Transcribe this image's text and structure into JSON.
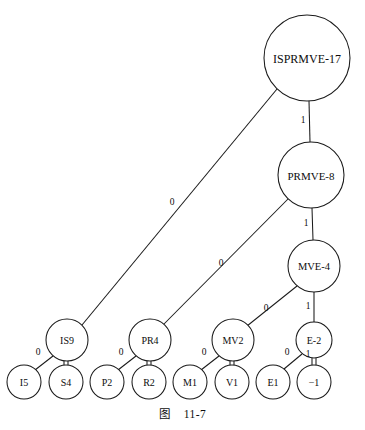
{
  "figure": {
    "caption_label": "图",
    "caption_number": "11-7",
    "caption_full": "图    11-7",
    "line_color": "#1a1a1a",
    "text_color": "#0d0d0d",
    "background_color": "#ffffff"
  },
  "diagram": {
    "type": "binary-decision-tree",
    "nodes": [
      {
        "id": "root",
        "label": "ISPRMVE-17",
        "cx": 307,
        "cy": 58,
        "r": 43,
        "font_size": 12
      },
      {
        "id": "n2",
        "label": "PRMVE-8",
        "cx": 311,
        "cy": 175,
        "r": 33,
        "font_size": 11
      },
      {
        "id": "n3",
        "label": "MVE-4",
        "cx": 314,
        "cy": 266,
        "r": 26,
        "font_size": 10.5
      },
      {
        "id": "is9",
        "label": "IS9",
        "cx": 67,
        "cy": 340,
        "r": 21,
        "font_size": 10
      },
      {
        "id": "pr4",
        "label": "PR4",
        "cx": 150,
        "cy": 340,
        "r": 21,
        "font_size": 10
      },
      {
        "id": "mv2",
        "label": "MV2",
        "cx": 233,
        "cy": 340,
        "r": 21,
        "font_size": 10
      },
      {
        "id": "e2",
        "label": "E-2",
        "cx": 314,
        "cy": 340,
        "r": 18,
        "font_size": 10
      },
      {
        "id": "l_i5",
        "label": "I5",
        "cx": 24,
        "cy": 382,
        "r": 17,
        "font_size": 10
      },
      {
        "id": "l_s4",
        "label": "S4",
        "cx": 66,
        "cy": 382,
        "r": 17,
        "font_size": 10
      },
      {
        "id": "l_p2",
        "label": "P2",
        "cx": 107,
        "cy": 382,
        "r": 17,
        "font_size": 10
      },
      {
        "id": "l_r2",
        "label": "R2",
        "cx": 149,
        "cy": 382,
        "r": 17,
        "font_size": 10
      },
      {
        "id": "l_m1",
        "label": "M1",
        "cx": 190,
        "cy": 382,
        "r": 17,
        "font_size": 10
      },
      {
        "id": "l_v1",
        "label": "V1",
        "cx": 232,
        "cy": 382,
        "r": 17,
        "font_size": 10
      },
      {
        "id": "l_e1",
        "label": "E1",
        "cx": 273,
        "cy": 382,
        "r": 17,
        "font_size": 10
      },
      {
        "id": "l_neg1",
        "label": "−1",
        "cx": 314,
        "cy": 382,
        "r": 17,
        "font_size": 10
      }
    ],
    "edges": [
      {
        "id": "e_root_is9",
        "from": "root",
        "to": "is9",
        "label": "0",
        "style": "single",
        "x1": 277,
        "y1": 89,
        "x2": 82,
        "y2": 325,
        "lx": 172,
        "ly": 202
      },
      {
        "id": "e_root_n2",
        "from": "root",
        "to": "n2",
        "label": "1",
        "style": "single",
        "x1": 309,
        "y1": 101,
        "x2": 310,
        "y2": 142,
        "lx": 303,
        "ly": 120
      },
      {
        "id": "e_n2_pr4",
        "from": "n2",
        "to": "pr4",
        "label": "0",
        "style": "single",
        "x1": 288,
        "y1": 199,
        "x2": 164,
        "y2": 324,
        "lx": 221,
        "ly": 263
      },
      {
        "id": "e_n2_n3",
        "from": "n2",
        "to": "n3",
        "label": "1",
        "style": "single",
        "x1": 312,
        "y1": 208,
        "x2": 313,
        "y2": 240,
        "lx": 306,
        "ly": 223
      },
      {
        "id": "e_n3_mv2",
        "from": "n3",
        "to": "mv2",
        "label": "0",
        "style": "single",
        "x1": 297,
        "y1": 286,
        "x2": 247,
        "y2": 326,
        "lx": 266,
        "ly": 308
      },
      {
        "id": "e_n3_e2",
        "from": "n3",
        "to": "e2",
        "label": "1",
        "style": "single",
        "x1": 314,
        "y1": 292,
        "x2": 314,
        "y2": 322,
        "lx": 308,
        "ly": 306
      },
      {
        "id": "e_is9_i5",
        "from": "is9",
        "to": "l_i5",
        "label": "0",
        "style": "single",
        "x1": 53,
        "y1": 356,
        "x2": 35,
        "y2": 370,
        "lx": 38,
        "ly": 352
      },
      {
        "id": "e_is9_s4",
        "from": "is9",
        "to": "l_s4",
        "label": "",
        "style": "double",
        "x1": 66,
        "y1": 361,
        "x2": 66,
        "y2": 365,
        "lx": 0,
        "ly": 0
      },
      {
        "id": "e_pr4_p2",
        "from": "pr4",
        "to": "l_p2",
        "label": "0",
        "style": "single",
        "x1": 136,
        "y1": 356,
        "x2": 118,
        "y2": 370,
        "lx": 121,
        "ly": 352
      },
      {
        "id": "e_pr4_r2",
        "from": "pr4",
        "to": "l_r2",
        "label": "",
        "style": "double",
        "x1": 149,
        "y1": 361,
        "x2": 149,
        "y2": 365,
        "lx": 0,
        "ly": 0
      },
      {
        "id": "e_mv2_m1",
        "from": "mv2",
        "to": "l_m1",
        "label": "0",
        "style": "single",
        "x1": 219,
        "y1": 356,
        "x2": 201,
        "y2": 370,
        "lx": 204,
        "ly": 352
      },
      {
        "id": "e_mv2_v1",
        "from": "mv2",
        "to": "l_v1",
        "label": "",
        "style": "double",
        "x1": 232,
        "y1": 361,
        "x2": 232,
        "y2": 365,
        "lx": 0,
        "ly": 0
      },
      {
        "id": "e_e2_e1",
        "from": "e2",
        "to": "l_e1",
        "label": "0",
        "style": "single",
        "x1": 302,
        "y1": 354,
        "x2": 284,
        "y2": 369,
        "lx": 287,
        "ly": 352
      },
      {
        "id": "e_e2_neg1",
        "from": "e2",
        "to": "l_neg1",
        "label": "1",
        "style": "double",
        "x1": 314,
        "y1": 358,
        "x2": 314,
        "y2": 365,
        "lx": 308,
        "ly": 354
      }
    ]
  }
}
